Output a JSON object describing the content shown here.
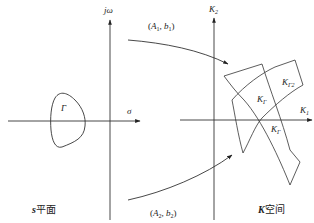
{
  "diagram": {
    "stroke_color": "#333333",
    "left_plane": {
      "caption_prefix": "s",
      "caption_suffix": "平面",
      "vertical_axis_label": "jω",
      "horizontal_axis_label": "σ",
      "contour_label": "Γ"
    },
    "right_plane": {
      "caption_prefix": "K",
      "caption_suffix": "空间",
      "vertical_axis_label_base": "K",
      "vertical_axis_label_sub": "2",
      "horizontal_axis_label_base": "K",
      "horizontal_axis_label_sub": "1",
      "region_labels": [
        {
          "base": "K",
          "sub": "Γ"
        },
        {
          "base": "K",
          "sub": "Γ2"
        },
        {
          "base": "K",
          "sub": "Γ"
        }
      ]
    },
    "mappings": [
      {
        "label_open": "(",
        "a_base": "A",
        "a_sub": "1",
        "sep": ", ",
        "b_base": "b",
        "b_sub": "1",
        "label_close": ")"
      },
      {
        "label_open": "(",
        "a_base": "A",
        "a_sub": "2",
        "sep": ", ",
        "b_base": "b",
        "b_sub": "2",
        "label_close": ")"
      }
    ]
  }
}
